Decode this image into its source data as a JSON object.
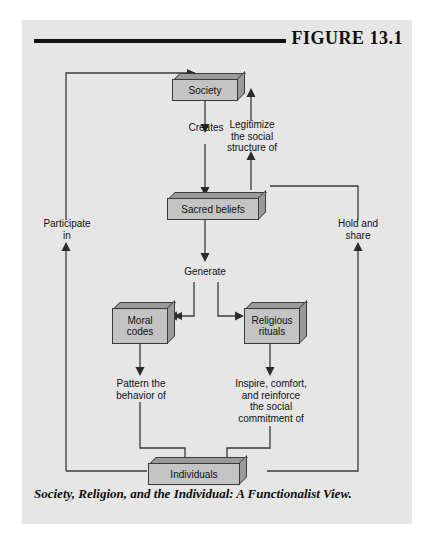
{
  "figure": {
    "label": "FIGURE  13.1",
    "caption": "Society, Religion, and the Individual: A Functionalist View."
  },
  "nodes": {
    "society": "Society",
    "sacred_beliefs": "Sacred beliefs",
    "moral_codes": "Moral\ncodes",
    "religious_rituals": "Religious\nrituals",
    "individuals": "Individuals"
  },
  "flow_labels": {
    "creates": "Creates",
    "legitimize": "Legitimize\nthe social\nstructure of",
    "generate": "Generate",
    "participate": "Participate\nin",
    "hold_and_share": "Hold and\nshare",
    "pattern": "Pattern the\nbehavior of",
    "inspire": "Inspire, comfort,\nand reinforce\nthe social\ncommitment of"
  },
  "colors": {
    "panel_background": "#e6e6e6",
    "page_background": "#ffffff",
    "box_face": "#c4c4c4",
    "box_shade": "#9a9a9a",
    "line": "#3a3a3a",
    "text": "#111111",
    "rule": "#111111"
  },
  "diagram_flow": [
    {
      "from": "Individuals",
      "to": "Society",
      "label": "Participate in"
    },
    {
      "from": "Society",
      "to": "Sacred beliefs",
      "label": "Creates"
    },
    {
      "from": "Sacred beliefs",
      "to": "Society",
      "label": "Legitimize the social structure of"
    },
    {
      "from": "Sacred beliefs",
      "to": "Moral codes",
      "label": "Generate"
    },
    {
      "from": "Sacred beliefs",
      "to": "Religious rituals",
      "label": "Generate"
    },
    {
      "from": "Moral codes",
      "to": "Individuals",
      "label": "Pattern the behavior of"
    },
    {
      "from": "Religious rituals",
      "to": "Individuals",
      "label": "Inspire, comfort, and reinforce the social commitment of"
    },
    {
      "from": "Individuals",
      "to": "Sacred beliefs",
      "label": "Hold and share"
    }
  ]
}
